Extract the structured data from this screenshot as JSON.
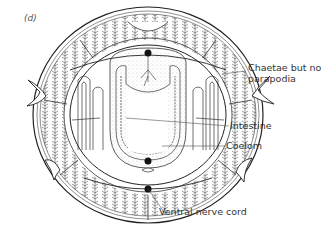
{
  "figure": {
    "panel_letter": "(d)",
    "colors": {
      "ink": "#222222",
      "label_text": "#333333",
      "background": "#ffffff",
      "stipple": "#bbbbbb"
    }
  },
  "labels": [
    {
      "id": "chaetae",
      "line1": "Chaetae but no",
      "line2": "parapodia"
    },
    {
      "id": "intestine",
      "text": "Intestine"
    },
    {
      "id": "coelom",
      "text": "Coelom"
    },
    {
      "id": "ventral_nerve_cord",
      "text": "Ventral nerve cord"
    }
  ]
}
